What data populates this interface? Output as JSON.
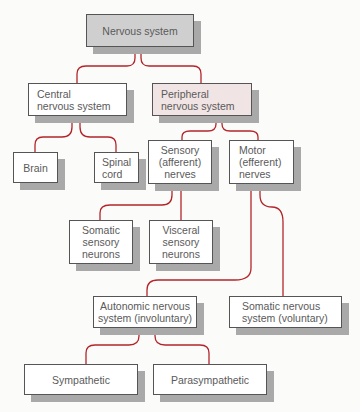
{
  "diagram": {
    "title": "Nervous system",
    "colors": {
      "connector": "#b3252b",
      "root_fill": "#cfcfcf",
      "pns_fill": "#f1e4e4",
      "node_fill": "#ffffff",
      "shadow": "#a9a9a9",
      "text": "#5a5a5a"
    },
    "nodes": {
      "nervous_system": "Nervous system",
      "cns": "Central\nnervous system",
      "pns": "Peripheral\nnervous system",
      "brain": "Brain",
      "spinal_cord": "Spinal\ncord",
      "sensory": "Sensory\n(afferent)\nnerves",
      "motor": "Motor\n(efferent)\nnerves",
      "somatic_sensory": "Somatic\nsensory\nneurons",
      "visceral_sensory": "Visceral\nsensory\nneurons",
      "autonomic": "Autonomic nervous\nsystem (involuntary)",
      "somatic_ns": "Somatic nervous\nsystem (voluntary)",
      "sympathetic": "Sympathetic",
      "parasympathetic": "Parasympathetic"
    },
    "edges": [
      [
        "Nervous system",
        "Central nervous system"
      ],
      [
        "Nervous system",
        "Peripheral nervous system"
      ],
      [
        "Central nervous system",
        "Brain"
      ],
      [
        "Central nervous system",
        "Spinal cord"
      ],
      [
        "Peripheral nervous system",
        "Sensory (afferent) nerves"
      ],
      [
        "Peripheral nervous system",
        "Motor (efferent) nerves"
      ],
      [
        "Sensory (afferent) nerves",
        "Somatic sensory neurons"
      ],
      [
        "Sensory (afferent) nerves",
        "Visceral sensory neurons"
      ],
      [
        "Motor (efferent) nerves",
        "Autonomic nervous system (involuntary)"
      ],
      [
        "Motor (efferent) nerves",
        "Somatic nervous system (voluntary)"
      ],
      [
        "Autonomic nervous system (involuntary)",
        "Sympathetic"
      ],
      [
        "Autonomic nervous system (involuntary)",
        "Parasympathetic"
      ]
    ]
  }
}
